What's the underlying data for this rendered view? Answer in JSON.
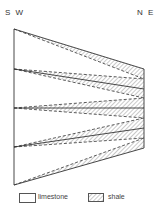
{
  "orientation": {
    "left": "S W",
    "right": "N E"
  },
  "legend": [
    {
      "label": "limestone",
      "pattern": "blank"
    },
    {
      "label": "shale",
      "pattern": "hatched"
    }
  ],
  "colors": {
    "line": "#333333",
    "hatch": "#777777",
    "background": "#ffffff"
  }
}
